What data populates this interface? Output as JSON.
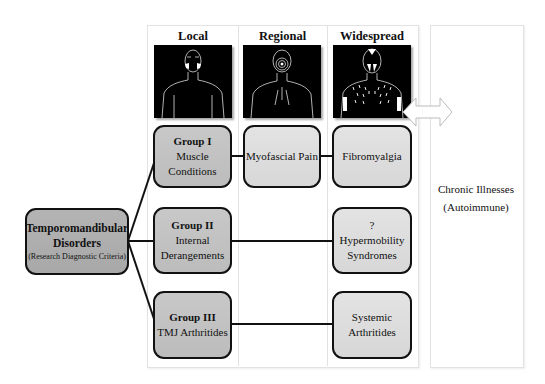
{
  "columns": [
    {
      "title": "Local",
      "figure_icon": "body-figure-local-pain-icon"
    },
    {
      "title": "Regional",
      "figure_icon": "body-figure-regional-pain-icon"
    },
    {
      "title": "Widespread",
      "figure_icon": "body-figure-widespread-pain-icon"
    }
  ],
  "root": {
    "title": "Temporomandibular Disorders",
    "title_line1": "Temporomandibular",
    "title_line2": "Disorders",
    "subtitle": "(Research Diagnostic Criteria)"
  },
  "groups": [
    {
      "heading": "Group I",
      "line1": "Muscle",
      "line2": "Conditions"
    },
    {
      "heading": "Group II",
      "line1": "Internal",
      "line2": "Derangements"
    },
    {
      "heading": "Group III",
      "line1": "TMJ Arthritides",
      "line2": ""
    }
  ],
  "regional": [
    {
      "label": "Myofascial Pain"
    }
  ],
  "widespread": [
    {
      "line1": "Fibromyalgia",
      "line2": "",
      "line3": ""
    },
    {
      "line1": "?",
      "line2": "Hypermobility",
      "line3": "Syndromes"
    },
    {
      "line1": "Systemic",
      "line2": "Arthritides",
      "line3": ""
    }
  ],
  "right_panel": {
    "line1": "Chronic Illnesses",
    "line2": "(Autoimmune)"
  },
  "arrow": {
    "type": "double-headed",
    "icon": "double-arrow-icon"
  },
  "colors": {
    "tmd_box": "#ababab",
    "group_box": "#c2c2c2",
    "condition_box": "#dcdcdc",
    "border": "#111111",
    "figure_bg": "#000000"
  }
}
